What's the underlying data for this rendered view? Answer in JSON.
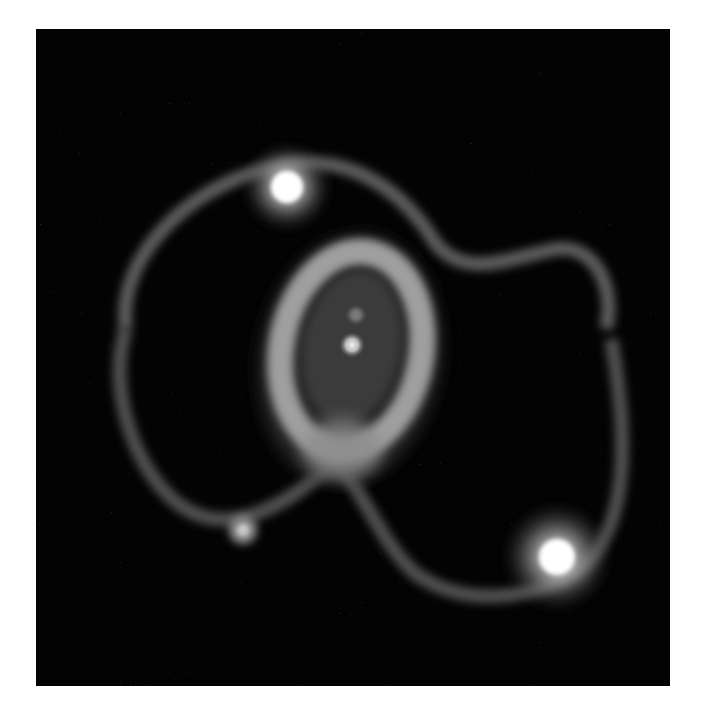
{
  "image": {
    "subject": "Ring nebula system around a central point source with two bright stars",
    "caption": "",
    "background_color": "#030303",
    "page_background": "#ffffff",
    "frame": {
      "x": 36,
      "y": 29,
      "width": 634,
      "height": 657
    },
    "features": {
      "central_source": {
        "cx": 316,
        "cy": 316,
        "label": "central-source"
      },
      "inner_ring": {
        "cx": 316,
        "cy": 318,
        "rx": 70,
        "ry": 100,
        "rotation": 10
      },
      "outer_loop_north": {
        "label": "outer-loop-north"
      },
      "outer_loop_south": {
        "label": "outer-loop-south"
      },
      "star_upper_left": {
        "cx": 251,
        "cy": 158
      },
      "star_lower_right": {
        "cx": 521,
        "cy": 528
      },
      "faint_source_lower_left": {
        "cx": 207,
        "cy": 501
      }
    }
  }
}
